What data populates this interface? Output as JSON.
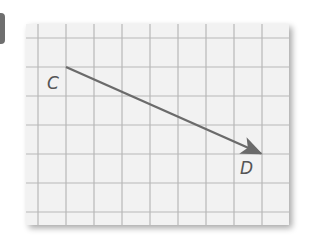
{
  "figure": {
    "type": "directed-segment-on-grid",
    "grid": {
      "columns": 9,
      "rows": 7,
      "background": "#f2f2f2",
      "line_color": "#b5b5b5"
    },
    "points": [
      {
        "label": "C",
        "grid_x": 1,
        "grid_y": 1
      },
      {
        "label": "D",
        "grid_x": 8,
        "grid_y": 4
      }
    ],
    "vector": {
      "from": "C",
      "to": "D",
      "color": "#6b6b6b"
    },
    "labels": {
      "start": "C",
      "end": "D"
    }
  }
}
